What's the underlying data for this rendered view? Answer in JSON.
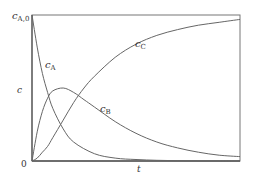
{
  "chart_data": {
    "type": "line",
    "title": "",
    "xlabel": "t",
    "ylabel": "c",
    "y_ticks": [
      {
        "label": "0",
        "value": 0
      },
      {
        "label": "c_A,0",
        "value": 1
      }
    ],
    "ylim": [
      0,
      1
    ],
    "xlim": [
      0,
      1
    ],
    "grid": false,
    "legend": "inline curve labels",
    "series": [
      {
        "name": "c_A",
        "label_main": "c",
        "label_sub": "A",
        "x": [
          0,
          0.025,
          0.05,
          0.075,
          0.1,
          0.15,
          0.2,
          0.3,
          0.4,
          0.5,
          0.6,
          0.7,
          0.8,
          0.9,
          1.0
        ],
        "y": [
          1.0,
          0.78,
          0.6,
          0.47,
          0.36,
          0.22,
          0.13,
          0.05,
          0.02,
          0.01,
          0.005,
          0.002,
          0.001,
          0.0,
          0.0
        ]
      },
      {
        "name": "c_B",
        "label_main": "c",
        "label_sub": "B",
        "x": [
          0,
          0.025,
          0.05,
          0.075,
          0.1,
          0.15,
          0.2,
          0.25,
          0.3,
          0.4,
          0.5,
          0.6,
          0.7,
          0.8,
          0.9,
          1.0
        ],
        "y": [
          0.0,
          0.2,
          0.34,
          0.43,
          0.48,
          0.5,
          0.47,
          0.42,
          0.37,
          0.27,
          0.19,
          0.13,
          0.09,
          0.06,
          0.04,
          0.03
        ]
      },
      {
        "name": "c_C",
        "label_main": "c",
        "label_sub": "C",
        "x": [
          0,
          0.025,
          0.05,
          0.075,
          0.1,
          0.15,
          0.2,
          0.25,
          0.3,
          0.4,
          0.5,
          0.6,
          0.7,
          0.8,
          0.9,
          1.0
        ],
        "y": [
          0.0,
          0.02,
          0.06,
          0.1,
          0.16,
          0.28,
          0.4,
          0.5,
          0.58,
          0.71,
          0.8,
          0.86,
          0.9,
          0.93,
          0.95,
          0.97
        ]
      }
    ]
  },
  "labels": {
    "y_axis": "c",
    "x_axis": "t",
    "zero": "0",
    "top_main": "c",
    "top_sub": "A,0",
    "a_main": "c",
    "a_sub": "A",
    "b_main": "c",
    "b_sub": "B",
    "c_main": "c",
    "c_sub": "C"
  }
}
